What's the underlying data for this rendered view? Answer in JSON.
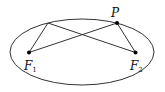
{
  "diagram": {
    "type": "ellipse-foci",
    "ellipse": {
      "cx": 82,
      "cy": 52,
      "rx": 72,
      "ry": 33,
      "stroke": "#333333"
    },
    "points": {
      "P": {
        "label": "P",
        "x": 117,
        "y": 23
      },
      "Q": {
        "label": "",
        "x": 48,
        "y": 23
      },
      "F1": {
        "label": "F",
        "subscript": "1",
        "x": 29,
        "y": 52.5
      },
      "F2": {
        "label": "F",
        "subscript": "2",
        "x": 135.5,
        "y": 52.5
      }
    },
    "segments": [
      [
        "Q",
        "F1"
      ],
      [
        "Q",
        "F2"
      ],
      [
        "P",
        "F1"
      ],
      [
        "P",
        "F2"
      ]
    ],
    "line_color": "#333333",
    "dot_color": "#000000"
  }
}
